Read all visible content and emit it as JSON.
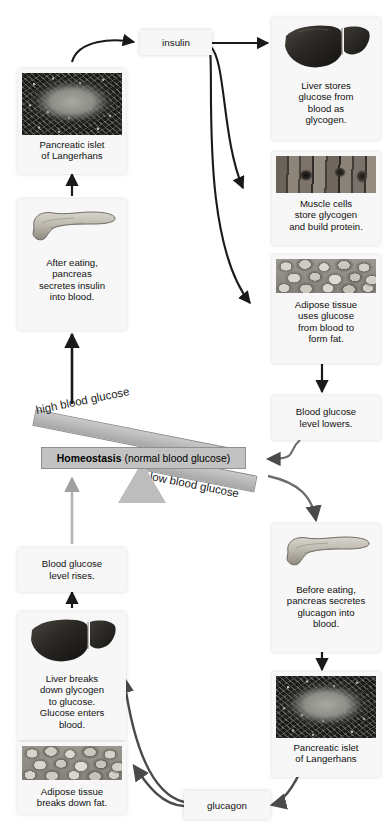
{
  "diagram": {
    "background_color": "#ffffff",
    "card_color": "#f7f7f7",
    "beam_color": "#b6b6b6",
    "arrow_color": "#1a1a1a",
    "light_arrow_color": "#9a9a9a"
  },
  "hormones": {
    "insulin": "insulin",
    "glucagon": "glucagon"
  },
  "balance": {
    "high_label": "high blood glucose",
    "low_label": "low blood glucose",
    "center_bold": "Homeostasis",
    "center_rest": "(normal blood glucose)"
  },
  "insulin_pathway": {
    "islet": {
      "caption_line1": "Pancreatic islet",
      "caption_line2": "of Langerhans",
      "image": "islet-micrograph"
    },
    "pancreas": {
      "caption_line1": "After eating,",
      "caption_line2": "pancreas",
      "caption_line3": "secretes insulin",
      "caption_line4": "into blood.",
      "image": "pancreas-illustration"
    },
    "targets": [
      {
        "image": "liver-illustration",
        "caption_line1": "Liver stores",
        "caption_line2": "glucose from",
        "caption_line3": "blood as",
        "caption_line4": "glycogen."
      },
      {
        "image": "muscle-micrograph",
        "caption_line1": "Muscle cells",
        "caption_line2": "store glycogen",
        "caption_line3": "and build protein."
      },
      {
        "image": "adipose-micrograph",
        "caption_line1": "Adipose tissue",
        "caption_line2": "uses glucose",
        "caption_line3": "from blood to",
        "caption_line4": "form fat."
      }
    ],
    "result": {
      "caption_line1": "Blood glucose",
      "caption_line2": "level lowers."
    }
  },
  "glucagon_pathway": {
    "pancreas": {
      "caption_line1": "Before eating,",
      "caption_line2": "pancreas secretes",
      "caption_line3": "glucagon into",
      "caption_line4": "blood.",
      "image": "pancreas-illustration"
    },
    "islet": {
      "caption_line1": "Pancreatic islet",
      "caption_line2": "of Langerhans",
      "image": "islet-micrograph"
    },
    "targets": [
      {
        "image": "liver-illustration",
        "caption_line1": "Liver breaks",
        "caption_line2": "down glycogen",
        "caption_line3": "to glucose.",
        "caption_line4": "Glucose enters",
        "caption_line5": "blood."
      },
      {
        "image": "adipose-micrograph",
        "caption_line1": "Adipose tissue",
        "caption_line2": "breaks down fat."
      }
    ],
    "result": {
      "caption_line1": "Blood glucose",
      "caption_line2": "level rises."
    }
  }
}
